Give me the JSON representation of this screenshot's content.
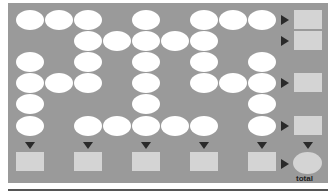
{
  "diagram": {
    "colors": {
      "panel": "#9a9a9a",
      "oval": "#ffffff",
      "box": "#d4d4d4",
      "arrow": "#2a2a2a"
    },
    "grid": {
      "columns": 9,
      "rows": 6,
      "col_x": [
        16,
        45,
        74,
        103,
        132,
        161,
        190,
        219,
        248
      ],
      "row_y": [
        10,
        31,
        52,
        73,
        94,
        116
      ],
      "ovals": [
        [
          0,
          0
        ],
        [
          0,
          1
        ],
        [
          0,
          2
        ],
        [
          0,
          4
        ],
        [
          0,
          6
        ],
        [
          0,
          7
        ],
        [
          0,
          8
        ],
        [
          1,
          2
        ],
        [
          1,
          3
        ],
        [
          1,
          4
        ],
        [
          1,
          5
        ],
        [
          1,
          6
        ],
        [
          2,
          0
        ],
        [
          2,
          2
        ],
        [
          2,
          4
        ],
        [
          2,
          6
        ],
        [
          2,
          8
        ],
        [
          3,
          0
        ],
        [
          3,
          1
        ],
        [
          3,
          2
        ],
        [
          3,
          4
        ],
        [
          3,
          6
        ],
        [
          3,
          7
        ],
        [
          3,
          8
        ],
        [
          4,
          0
        ],
        [
          4,
          4
        ],
        [
          4,
          8
        ],
        [
          5,
          0
        ],
        [
          5,
          2
        ],
        [
          5,
          3
        ],
        [
          5,
          4
        ],
        [
          5,
          5
        ],
        [
          5,
          6
        ],
        [
          5,
          8
        ]
      ]
    },
    "row_outputs": [
      0,
      1,
      3,
      5
    ],
    "column_outputs": [
      0,
      2,
      4,
      6,
      8
    ],
    "total_label": "total"
  }
}
